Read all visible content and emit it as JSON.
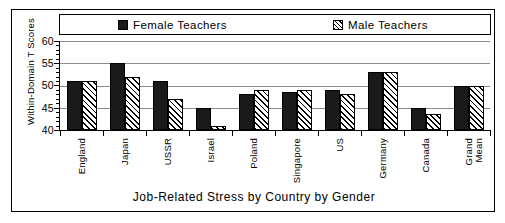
{
  "chart_data": {
    "type": "bar",
    "title": "",
    "xlabel": "Job-Related Stress by Country by Gender",
    "ylabel": "Within-Domain T Scores",
    "ylim": [
      40,
      60
    ],
    "yticks": [
      40,
      45,
      50,
      55,
      60
    ],
    "grid": true,
    "legend_position": "top",
    "categories": [
      "England",
      "Japan",
      "USSR",
      "Israel",
      "Poland",
      "Singapore",
      "US",
      "Germany",
      "Canada",
      "Grand\nMean"
    ],
    "series": [
      {
        "name": "Female  Teachers",
        "style": "solid",
        "color": "#1a1a1a",
        "values": [
          51,
          55,
          51,
          45,
          48,
          48.5,
          49,
          53,
          45,
          50
        ]
      },
      {
        "name": "Male  Teachers",
        "style": "hatched",
        "color": "#ffffff",
        "values": [
          51,
          52,
          47,
          41,
          49,
          49,
          48,
          53,
          43.5,
          50
        ]
      }
    ]
  },
  "legend": {
    "entries": [
      {
        "label": "Female  Teachers",
        "swatch": "solid-square-icon"
      },
      {
        "label": "Male  Teachers",
        "swatch": "hatched-square-icon"
      }
    ]
  },
  "axes": {
    "y_title": "Within-Domain T Scores",
    "x_title": "Job-Related Stress by Country by Gender",
    "y_tick_labels": [
      "60",
      "55",
      "50",
      "45",
      "40"
    ]
  }
}
